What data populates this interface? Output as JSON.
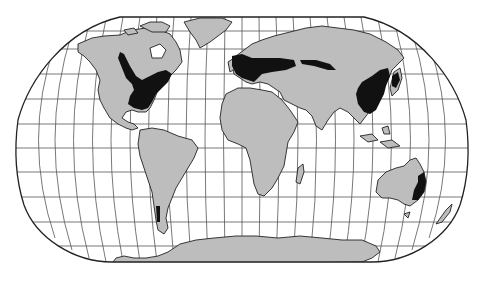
{
  "map": {
    "projection": "Robinson",
    "type": "world-thematic-map",
    "background_color": "#ffffff",
    "land_color": "#bdbdbd",
    "highlight_color": "#111111",
    "graticule_color": "#555555",
    "outline_color": "#222222",
    "graticule": {
      "meridian_step_deg": 15,
      "parallel_step_deg": 15
    },
    "highlighted_regions": [
      "Eastern United States and southeastern Canada",
      "Western and Central Europe extending east across Russia",
      "Eastern China, Korea and Japan",
      "Southeastern Australia",
      "Southern Chile"
    ],
    "continents": [
      "North America",
      "Greenland",
      "South America",
      "Europe",
      "Asia",
      "Africa",
      "Madagascar",
      "Australia",
      "New Zealand",
      "Antarctica"
    ]
  }
}
